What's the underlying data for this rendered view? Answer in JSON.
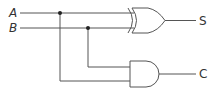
{
  "diagram": {
    "inputs": [
      {
        "label": "A"
      },
      {
        "label": "B"
      }
    ],
    "gates": [
      {
        "type": "XOR",
        "output_label": "S"
      },
      {
        "type": "AND",
        "output_label": "C"
      }
    ],
    "colors": {
      "line": "#555555",
      "text": "#333333",
      "background": "#ffffff"
    }
  }
}
